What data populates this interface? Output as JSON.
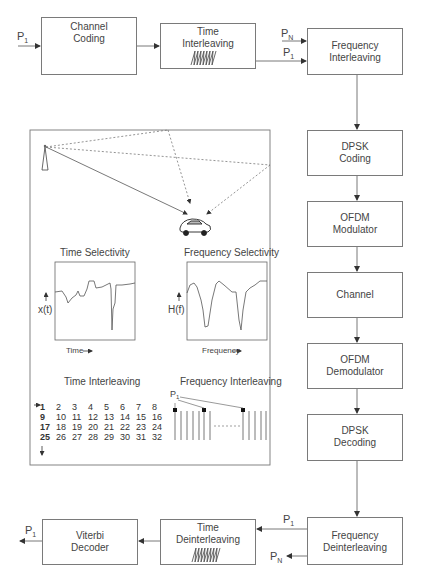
{
  "diagram": {
    "type": "OFDM transmission block diagram",
    "blocks": {
      "channel_coding": {
        "line1": "Channel",
        "line2": "Coding"
      },
      "time_interleaving": {
        "line1": "Time",
        "line2": "Interleaving"
      },
      "frequency_interleaving": {
        "line1": "Frequency",
        "line2": "Interleaving"
      },
      "dpsk_coding": {
        "line1": "DPSK",
        "line2": "Coding"
      },
      "ofdm_modulator": {
        "line1": "OFDM",
        "line2": "Modulator"
      },
      "channel": {
        "line1": "Channel"
      },
      "ofdm_demodulator": {
        "line1": "OFDM",
        "line2": "Demodulator"
      },
      "dpsk_decoding": {
        "line1": "DPSK",
        "line2": "Decoding"
      },
      "frequency_deinterleaving": {
        "line1": "Frequency",
        "line2": "Deinterleaving"
      },
      "time_deinterleaving": {
        "line1": "Time",
        "line2": "Deinterleaving"
      },
      "viterbi_decoder": {
        "line1": "Viterbi",
        "line2": "Decoder"
      }
    },
    "signals": {
      "p": "P",
      "sub_1": "1",
      "sub_n": "N"
    },
    "panel": {
      "time_selectivity": {
        "title": "Time Selectivity",
        "ylabel": "x(t)",
        "xlabel": "Time"
      },
      "frequency_selectivity": {
        "title": "Frequency Selectivity",
        "ylabel": "H(f)",
        "xlabel": "Frequency"
      },
      "time_interleaving": {
        "title": "Time Interleaving",
        "rows": [
          [
            "1",
            "2",
            "3",
            "4",
            "5",
            "6",
            "7",
            "8"
          ],
          [
            "9",
            "10",
            "11",
            "12",
            "13",
            "14",
            "15",
            "16"
          ],
          [
            "17",
            "18",
            "19",
            "20",
            "21",
            "22",
            "23",
            "24"
          ],
          [
            "25",
            "26",
            "27",
            "28",
            "29",
            "30",
            "31",
            "32"
          ]
        ]
      },
      "frequency_interleaving": {
        "title": "Frequency Interleaving",
        "label_p": "P",
        "label_sub": "1"
      }
    }
  }
}
